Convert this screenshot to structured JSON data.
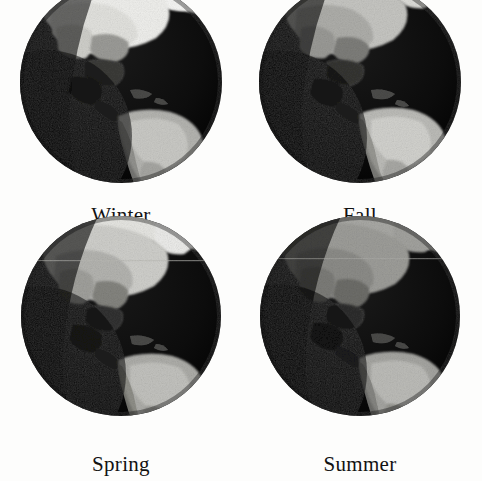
{
  "figure": {
    "name": "seasonal-earth-panels",
    "background_color": "#fdfdfc",
    "layout": "2x2 grid of Earth globe photographs centered on the Americas, each captioned with a season name",
    "globe_count": 4
  },
  "panels": [
    {
      "id": "winter",
      "label": "Winter",
      "position": "top-left",
      "globe": {
        "icon": "earth-globe-icon",
        "view": "Western Hemisphere / Americas",
        "disk_color": "#0b0b0b",
        "land_color": "#8e8e8e",
        "snow_color": "#f2f2f0",
        "ocean_color": "#0b0b0b",
        "snow_extent": 0.95,
        "north_tilt_deg": -23.5,
        "description": "Heavy bright snow cover across northern North America; South America fully lit and bright"
      }
    },
    {
      "id": "fall",
      "label": "Fall",
      "position": "top-right",
      "globe": {
        "icon": "earth-globe-icon",
        "view": "Western Hemisphere / Americas",
        "disk_color": "#0b0b0b",
        "land_color": "#8e8e8e",
        "snow_color": "#d8d8d4",
        "ocean_color": "#0b0b0b",
        "snow_extent": 0.45,
        "north_tilt_deg": 0,
        "description": "Moderate light cover over northern latitudes; mid-gray continents"
      }
    },
    {
      "id": "spring",
      "label": "Spring",
      "position": "bottom-left",
      "globe": {
        "icon": "earth-globe-icon",
        "view": "Western Hemisphere / Americas",
        "disk_color": "#0b0b0b",
        "land_color": "#7f7f7f",
        "snow_color": "#e4e4e0",
        "ocean_color": "#0b0b0b",
        "snow_extent": 0.6,
        "north_tilt_deg": 0,
        "description": "Partial snow remaining over far north; faint horizontal scan line crosses the disk"
      }
    },
    {
      "id": "summer",
      "label": "Summer",
      "position": "bottom-right",
      "globe": {
        "icon": "earth-globe-icon",
        "view": "Western Hemisphere / Americas",
        "disk_color": "#0b0b0b",
        "land_color": "#909090",
        "snow_color": "#b9b9b5",
        "ocean_color": "#0b0b0b",
        "snow_extent": 0.1,
        "north_tilt_deg": 23.5,
        "description": "No snow cover; uniformly mid-gray vegetated continents, faint horizontal scan line"
      }
    }
  ]
}
